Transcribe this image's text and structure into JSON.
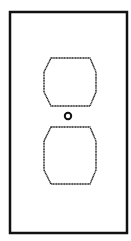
{
  "figure": {
    "subject": "duplex outlet cover plate",
    "stroke_color": "#111111",
    "background_color": "#ffffff",
    "plate": {
      "x": 10,
      "y": 12,
      "width": 117,
      "height": 221,
      "stroke_width": 2.5
    },
    "receptacles": [
      {
        "name": "upper",
        "points": "51,58 90,58 96,72 96,92 90,106 51,106 44,92 44,72"
      },
      {
        "name": "lower",
        "points": "51,127 90,127 96,141 96,170 90,184 51,184 44,170 44,141"
      }
    ],
    "screw": {
      "cx": 68,
      "cy": 116,
      "r": 3.2
    }
  }
}
